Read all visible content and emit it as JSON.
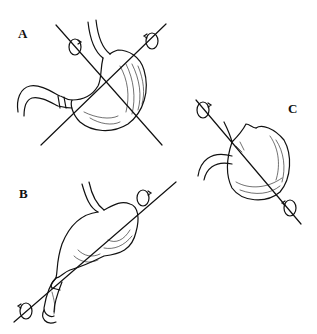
{
  "figure": {
    "panels": [
      {
        "label": "A",
        "subject": "stomach with two crossing rotation axes"
      },
      {
        "label": "B",
        "subject": "stomach with organoaxial rotation axis"
      },
      {
        "label": "C",
        "subject": "rotated stomach with mesenteroaxial axis"
      }
    ]
  }
}
